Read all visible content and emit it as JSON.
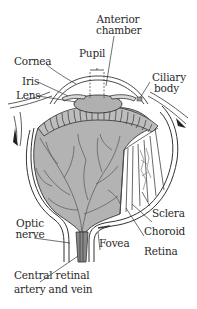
{
  "diagram": {
    "colors": {
      "background": "#ffffff",
      "fill_gray": "#b3b3b3",
      "line": "#333333",
      "vessel": "#555555"
    },
    "labels": {
      "anterior_chamber_1": "Anterior",
      "anterior_chamber_2": "chamber",
      "pupil": "Pupil",
      "cornea": "Cornea",
      "iris": "Iris",
      "lens": "Lens",
      "ciliary_body_1": "Ciliary",
      "ciliary_body_2": "body",
      "optic_nerve_1": "Optic",
      "optic_nerve_2": "nerve",
      "fovea": "Fovea",
      "sclera": "Sclera",
      "choroid": "Choroid",
      "retina": "Retina",
      "central_retinal_1": "Central retinal",
      "central_retinal_2": "artery and vein"
    }
  }
}
